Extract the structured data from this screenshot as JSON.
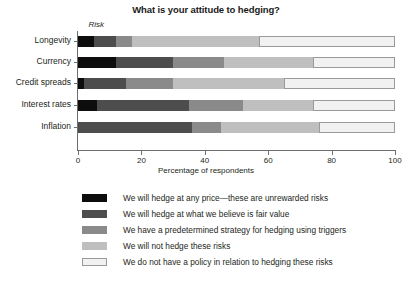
{
  "chart_data": {
    "type": "bar",
    "orientation": "horizontal",
    "stacked": true,
    "normalized": true,
    "title": "What is your attitude to hedging?",
    "xlabel": "Percentage of respondents",
    "ylabel": "Risk",
    "xlim": [
      0,
      100
    ],
    "grid": false,
    "legend_position": "bottom",
    "xticks": [
      0,
      20,
      40,
      60,
      80,
      100
    ],
    "xtick_labels": [
      "0",
      "20",
      "40",
      "60",
      "80",
      "100"
    ],
    "categories": [
      "Longevity",
      "Currency",
      "Credit spreads",
      "Interest rates",
      "Inflation"
    ],
    "series": [
      {
        "name": "We will hedge at any price—these are unrewarded risks",
        "color": "#0d0d0d",
        "values": [
          5,
          12,
          2,
          6,
          0
        ]
      },
      {
        "name": "We will hedge at what we believe is fair value",
        "color": "#4d4d4d",
        "values": [
          7,
          18,
          13,
          29,
          36
        ]
      },
      {
        "name": "We have a predetermined strategy for hedging using triggers",
        "color": "#8a8a8a",
        "values": [
          5,
          16,
          15,
          17,
          9
        ]
      },
      {
        "name": "We will not hedge these risks",
        "color": "#bfbfbf",
        "values": [
          40,
          28,
          35,
          22,
          31
        ]
      },
      {
        "name": "We do not have a policy in relation to hedging these risks",
        "color": "#f1f1f1",
        "values": [
          43,
          26,
          35,
          26,
          24
        ]
      }
    ]
  }
}
